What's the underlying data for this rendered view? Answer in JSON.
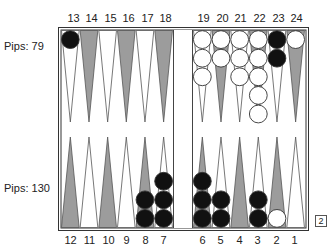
{
  "board": {
    "top_labels": [
      "13",
      "14",
      "15",
      "16",
      "17",
      "18",
      "19",
      "20",
      "21",
      "22",
      "23",
      "24"
    ],
    "bottom_labels": [
      "12",
      "11",
      "10",
      "9",
      "8",
      "7",
      "6",
      "5",
      "4",
      "3",
      "2",
      "1"
    ],
    "top_pips_label": "Pips: 79",
    "bottom_pips_label": "Pips: 130",
    "cube_value": "2",
    "colors": {
      "dark_point": "#9c9c9c",
      "light_point": "#ffffff",
      "point_outline": "#555555",
      "black_checker": "#111111",
      "white_checker": "#ffffff",
      "checker_outline": "#333333",
      "frame": "#333333"
    },
    "points": [
      {
        "point": 13,
        "row": "top",
        "shade": "light",
        "checkers": {
          "color": "black",
          "count": 1
        }
      },
      {
        "point": 14,
        "row": "top",
        "shade": "dark",
        "checkers": {
          "color": "none",
          "count": 0
        }
      },
      {
        "point": 15,
        "row": "top",
        "shade": "light",
        "checkers": {
          "color": "none",
          "count": 0
        }
      },
      {
        "point": 16,
        "row": "top",
        "shade": "dark",
        "checkers": {
          "color": "none",
          "count": 0
        }
      },
      {
        "point": 17,
        "row": "top",
        "shade": "light",
        "checkers": {
          "color": "none",
          "count": 0
        }
      },
      {
        "point": 18,
        "row": "top",
        "shade": "dark",
        "checkers": {
          "color": "none",
          "count": 0
        }
      },
      {
        "point": 19,
        "row": "top",
        "shade": "light",
        "checkers": {
          "color": "white",
          "count": 3
        }
      },
      {
        "point": 20,
        "row": "top",
        "shade": "dark",
        "checkers": {
          "color": "white",
          "count": 2
        }
      },
      {
        "point": 21,
        "row": "top",
        "shade": "light",
        "checkers": {
          "color": "white",
          "count": 3
        }
      },
      {
        "point": 22,
        "row": "top",
        "shade": "dark",
        "checkers": {
          "color": "white",
          "count": 5
        }
      },
      {
        "point": 23,
        "row": "top",
        "shade": "light",
        "checkers": {
          "color": "black",
          "count": 2
        }
      },
      {
        "point": 24,
        "row": "top",
        "shade": "dark",
        "checkers": {
          "color": "white",
          "count": 1
        }
      },
      {
        "point": 12,
        "row": "bottom",
        "shade": "dark",
        "checkers": {
          "color": "none",
          "count": 0
        }
      },
      {
        "point": 11,
        "row": "bottom",
        "shade": "light",
        "checkers": {
          "color": "none",
          "count": 0
        }
      },
      {
        "point": 10,
        "row": "bottom",
        "shade": "dark",
        "checkers": {
          "color": "none",
          "count": 0
        }
      },
      {
        "point": 9,
        "row": "bottom",
        "shade": "light",
        "checkers": {
          "color": "none",
          "count": 0
        }
      },
      {
        "point": 8,
        "row": "bottom",
        "shade": "dark",
        "checkers": {
          "color": "black",
          "count": 2
        }
      },
      {
        "point": 7,
        "row": "bottom",
        "shade": "light",
        "checkers": {
          "color": "black",
          "count": 3
        }
      },
      {
        "point": 6,
        "row": "bottom",
        "shade": "dark",
        "checkers": {
          "color": "black",
          "count": 3
        }
      },
      {
        "point": 5,
        "row": "bottom",
        "shade": "light",
        "checkers": {
          "color": "black",
          "count": 2
        }
      },
      {
        "point": 4,
        "row": "bottom",
        "shade": "dark",
        "checkers": {
          "color": "none",
          "count": 0
        }
      },
      {
        "point": 3,
        "row": "bottom",
        "shade": "light",
        "checkers": {
          "color": "black",
          "count": 2
        }
      },
      {
        "point": 2,
        "row": "bottom",
        "shade": "dark",
        "checkers": {
          "color": "white",
          "count": 1
        }
      },
      {
        "point": 1,
        "row": "bottom",
        "shade": "light",
        "checkers": {
          "color": "none",
          "count": 0
        }
      }
    ]
  }
}
